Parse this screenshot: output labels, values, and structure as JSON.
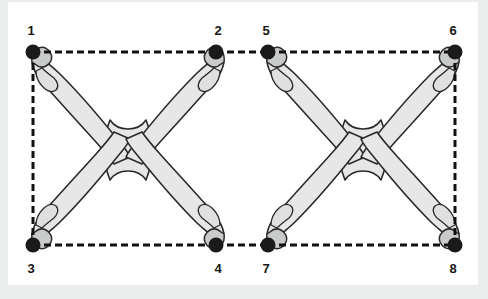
{
  "figure": {
    "background_color": "#eceded",
    "canvas_color": "#ffffff",
    "bone_fill": "#e6e7e6",
    "bone_stroke": "#2b2b2b",
    "cap_fill": "#c9cbca",
    "node_color": "#1a1a1a",
    "dash_color": "#111111",
    "label_color": "#151515",
    "node_radius": 7.5,
    "dash_pattern": "7,4",
    "dash_width": 3
  },
  "nodes": [
    {
      "id": "1",
      "label": "1",
      "x": 33,
      "y": 52,
      "label_x": 31,
      "label_y": 30
    },
    {
      "id": "2",
      "label": "2",
      "x": 216,
      "y": 52,
      "label_x": 218,
      "label_y": 30
    },
    {
      "id": "3",
      "label": "3",
      "x": 33,
      "y": 245,
      "label_x": 31,
      "label_y": 268
    },
    {
      "id": "4",
      "label": "4",
      "x": 216,
      "y": 245,
      "label_x": 218,
      "label_y": 268
    },
    {
      "id": "5",
      "label": "5",
      "x": 268,
      "y": 52,
      "label_x": 266,
      "label_y": 30
    },
    {
      "id": "6",
      "label": "6",
      "x": 455,
      "y": 52,
      "label_x": 453,
      "label_y": 30
    },
    {
      "id": "7",
      "label": "7",
      "x": 268,
      "y": 245,
      "label_x": 266,
      "label_y": 268
    },
    {
      "id": "8",
      "label": "8",
      "x": 455,
      "y": 245,
      "label_x": 453,
      "label_y": 268
    }
  ],
  "frames": [
    {
      "name": "left-frame",
      "nodes": [
        "1",
        "2",
        "4",
        "3"
      ]
    },
    {
      "name": "right-frame",
      "nodes": [
        "5",
        "6",
        "8",
        "7"
      ]
    }
  ],
  "constructs": [
    {
      "name": "left-construct",
      "center_x": 128,
      "center_y": 148,
      "arms": [
        "1",
        "2",
        "3",
        "4"
      ]
    },
    {
      "name": "right-construct",
      "center_x": 363,
      "center_y": 148,
      "arms": [
        "5",
        "6",
        "7",
        "8"
      ]
    }
  ]
}
